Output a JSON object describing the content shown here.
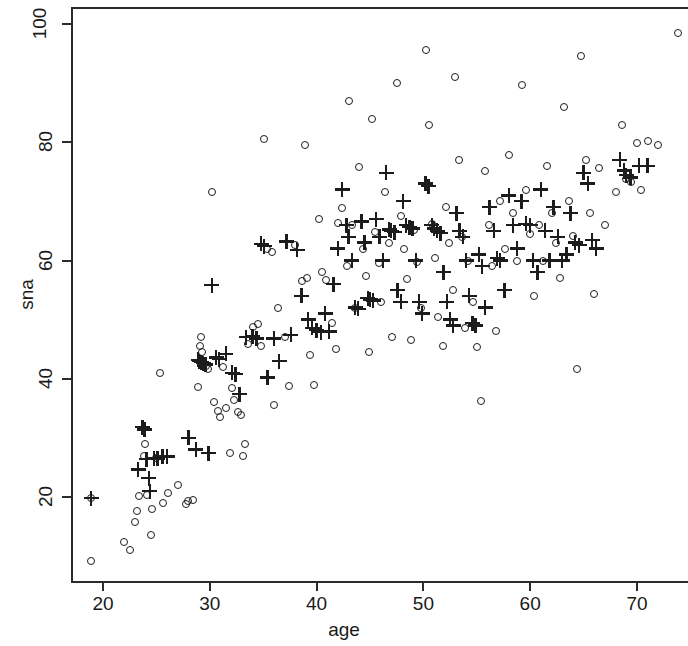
{
  "chart_data": {
    "type": "scatter",
    "title": "",
    "xlabel": "age",
    "ylabel": "sna",
    "xlim": [
      17.2,
      74.8
    ],
    "ylim": [
      7.3,
      104.0
    ],
    "xticks": [
      20,
      30,
      40,
      50,
      60,
      70
    ],
    "yticks": [
      20,
      40,
      60,
      80,
      100
    ],
    "grid": false,
    "legend": null,
    "frame": "box-open-right",
    "series": [
      {
        "name": "circle",
        "marker": "open-circle",
        "color": "#1c1c1c",
        "points": [
          [
            18.9,
            9.2
          ],
          [
            18.9,
            19.8
          ],
          [
            22.0,
            12.4
          ],
          [
            22.5,
            11.0
          ],
          [
            23.0,
            15.8
          ],
          [
            23.2,
            17.6
          ],
          [
            23.4,
            20.1
          ],
          [
            23.8,
            27.0
          ],
          [
            23.9,
            28.9
          ],
          [
            24.1,
            20.4
          ],
          [
            24.5,
            13.6
          ],
          [
            24.6,
            18.0
          ],
          [
            25.0,
            26.6
          ],
          [
            25.3,
            41.0
          ],
          [
            25.6,
            19.0
          ],
          [
            26.1,
            20.6
          ],
          [
            27.0,
            22.0
          ],
          [
            27.8,
            18.8
          ],
          [
            28.0,
            19.3
          ],
          [
            28.4,
            19.5
          ],
          [
            28.9,
            38.6
          ],
          [
            29.1,
            45.5
          ],
          [
            29.2,
            47.0
          ],
          [
            29.3,
            44.5
          ],
          [
            29.4,
            43.0
          ],
          [
            29.6,
            42.2
          ],
          [
            29.8,
            41.6
          ],
          [
            30.2,
            71.6
          ],
          [
            30.4,
            36.0
          ],
          [
            30.8,
            34.5
          ],
          [
            31.0,
            33.6
          ],
          [
            31.2,
            42.0
          ],
          [
            31.5,
            35.0
          ],
          [
            31.9,
            27.4
          ],
          [
            32.1,
            38.5
          ],
          [
            32.3,
            36.4
          ],
          [
            32.6,
            34.3
          ],
          [
            32.9,
            33.8
          ],
          [
            33.1,
            26.9
          ],
          [
            33.3,
            29.0
          ],
          [
            33.6,
            45.8
          ],
          [
            34.0,
            48.8
          ],
          [
            34.5,
            49.2
          ],
          [
            34.8,
            45.6
          ],
          [
            35.1,
            80.6
          ],
          [
            35.4,
            62.0
          ],
          [
            35.8,
            61.4
          ],
          [
            36.0,
            35.5
          ],
          [
            36.4,
            52.0
          ],
          [
            37.0,
            47.0
          ],
          [
            37.4,
            38.8
          ],
          [
            38.0,
            62.6
          ],
          [
            38.6,
            56.5
          ],
          [
            38.9,
            79.6
          ],
          [
            39.1,
            57.0
          ],
          [
            39.4,
            44.0
          ],
          [
            39.8,
            39.0
          ],
          [
            40.2,
            67.0
          ],
          [
            40.5,
            58.0
          ],
          [
            40.9,
            56.7
          ],
          [
            41.4,
            49.5
          ],
          [
            41.8,
            45.0
          ],
          [
            42.0,
            66.4
          ],
          [
            42.4,
            68.8
          ],
          [
            42.8,
            59.0
          ],
          [
            43.0,
            87.0
          ],
          [
            43.3,
            66.0
          ],
          [
            43.6,
            52.0
          ],
          [
            44.0,
            75.8
          ],
          [
            44.3,
            62.0
          ],
          [
            44.6,
            57.4
          ],
          [
            44.9,
            44.6
          ],
          [
            45.2,
            84.0
          ],
          [
            45.5,
            64.8
          ],
          [
            45.8,
            59.6
          ],
          [
            46.0,
            53.0
          ],
          [
            46.4,
            71.6
          ],
          [
            46.8,
            63.0
          ],
          [
            47.1,
            47.0
          ],
          [
            47.5,
            90.0
          ],
          [
            47.9,
            67.6
          ],
          [
            48.2,
            62.0
          ],
          [
            48.5,
            56.8
          ],
          [
            48.8,
            46.5
          ],
          [
            49.1,
            65.2
          ],
          [
            49.4,
            59.8
          ],
          [
            49.8,
            52.0
          ],
          [
            50.2,
            95.6
          ],
          [
            50.5,
            83.0
          ],
          [
            50.8,
            66.2
          ],
          [
            51.1,
            60.4
          ],
          [
            51.4,
            50.5
          ],
          [
            51.8,
            45.5
          ],
          [
            52.1,
            69.0
          ],
          [
            52.4,
            63.0
          ],
          [
            52.8,
            55.0
          ],
          [
            53.0,
            91.0
          ],
          [
            53.3,
            77.0
          ],
          [
            53.6,
            64.0
          ],
          [
            53.9,
            48.6
          ],
          [
            54.2,
            60.0
          ],
          [
            54.6,
            53.0
          ],
          [
            55.0,
            45.4
          ],
          [
            55.4,
            36.2
          ],
          [
            55.8,
            75.2
          ],
          [
            56.1,
            66.0
          ],
          [
            56.4,
            59.0
          ],
          [
            56.8,
            48.0
          ],
          [
            57.2,
            70.0
          ],
          [
            57.6,
            62.0
          ],
          [
            58.0,
            77.8
          ],
          [
            58.4,
            68.0
          ],
          [
            58.8,
            60.0
          ],
          [
            59.2,
            89.6
          ],
          [
            59.6,
            72.0
          ],
          [
            60.0,
            64.5
          ],
          [
            60.4,
            54.0
          ],
          [
            60.8,
            66.0
          ],
          [
            61.2,
            60.0
          ],
          [
            61.6,
            76.0
          ],
          [
            62.0,
            68.0
          ],
          [
            62.4,
            63.0
          ],
          [
            62.8,
            57.0
          ],
          [
            63.2,
            86.0
          ],
          [
            63.6,
            70.0
          ],
          [
            64.0,
            64.2
          ],
          [
            64.4,
            41.6
          ],
          [
            64.8,
            94.6
          ],
          [
            65.2,
            77.0
          ],
          [
            65.6,
            68.0
          ],
          [
            66.0,
            54.4
          ],
          [
            66.4,
            75.6
          ],
          [
            67.0,
            66.0
          ],
          [
            68.0,
            71.6
          ],
          [
            68.6,
            83.0
          ],
          [
            69.0,
            73.8
          ],
          [
            69.4,
            73.2
          ],
          [
            70.0,
            79.8
          ],
          [
            70.4,
            72.0
          ],
          [
            71.0,
            80.2
          ],
          [
            72.0,
            79.6
          ],
          [
            73.8,
            98.4
          ]
        ]
      },
      {
        "name": "plus",
        "marker": "plus",
        "color": "#1c1c1c",
        "points": [
          [
            18.9,
            19.8
          ],
          [
            23.3,
            24.6
          ],
          [
            23.7,
            31.8
          ],
          [
            23.9,
            31.4
          ],
          [
            24.1,
            26.4
          ],
          [
            24.3,
            23.2
          ],
          [
            24.4,
            21.0
          ],
          [
            24.8,
            26.5
          ],
          [
            25.1,
            26.5
          ],
          [
            25.6,
            26.8
          ],
          [
            26.0,
            26.8
          ],
          [
            28.0,
            30.0
          ],
          [
            28.7,
            28.0
          ],
          [
            28.9,
            43.2
          ],
          [
            29.0,
            43.0
          ],
          [
            29.2,
            42.8
          ],
          [
            29.4,
            42.6
          ],
          [
            29.6,
            42.4
          ],
          [
            29.9,
            27.4
          ],
          [
            30.2,
            55.8
          ],
          [
            30.6,
            43.6
          ],
          [
            30.9,
            43.3
          ],
          [
            31.5,
            44.2
          ],
          [
            32.1,
            41.0
          ],
          [
            32.4,
            40.8
          ],
          [
            32.8,
            37.4
          ],
          [
            33.4,
            47.0
          ],
          [
            34.0,
            47.2
          ],
          [
            34.4,
            46.8
          ],
          [
            34.8,
            62.8
          ],
          [
            35.1,
            62.4
          ],
          [
            35.4,
            40.2
          ],
          [
            36.0,
            46.8
          ],
          [
            36.5,
            43.0
          ],
          [
            37.2,
            63.2
          ],
          [
            37.6,
            47.4
          ],
          [
            38.2,
            61.8
          ],
          [
            38.6,
            54.0
          ],
          [
            39.2,
            50.0
          ],
          [
            39.6,
            48.6
          ],
          [
            40.0,
            48.2
          ],
          [
            40.4,
            47.9
          ],
          [
            40.8,
            51.0
          ],
          [
            41.2,
            48.0
          ],
          [
            41.6,
            56.0
          ],
          [
            42.0,
            62.0
          ],
          [
            42.4,
            72.0
          ],
          [
            42.8,
            66.0
          ],
          [
            43.0,
            64.0
          ],
          [
            43.3,
            60.0
          ],
          [
            43.6,
            52.0
          ],
          [
            43.9,
            51.8
          ],
          [
            44.2,
            66.6
          ],
          [
            44.5,
            63.0
          ],
          [
            44.8,
            53.6
          ],
          [
            45.0,
            53.4
          ],
          [
            45.3,
            53.2
          ],
          [
            45.6,
            67.0
          ],
          [
            45.9,
            64.0
          ],
          [
            46.2,
            60.0
          ],
          [
            46.5,
            74.8
          ],
          [
            46.8,
            65.2
          ],
          [
            47.0,
            65.0
          ],
          [
            47.3,
            64.8
          ],
          [
            47.6,
            55.0
          ],
          [
            47.9,
            53.0
          ],
          [
            48.1,
            70.0
          ],
          [
            48.4,
            66.0
          ],
          [
            48.7,
            65.6
          ],
          [
            49.0,
            65.4
          ],
          [
            49.3,
            60.0
          ],
          [
            49.6,
            53.0
          ],
          [
            49.9,
            51.0
          ],
          [
            50.2,
            73.0
          ],
          [
            50.5,
            72.6
          ],
          [
            50.8,
            66.0
          ],
          [
            51.0,
            65.4
          ],
          [
            51.3,
            65.0
          ],
          [
            51.6,
            64.6
          ],
          [
            51.9,
            58.0
          ],
          [
            52.2,
            53.0
          ],
          [
            52.5,
            50.0
          ],
          [
            52.8,
            49.0
          ],
          [
            53.1,
            68.0
          ],
          [
            53.4,
            65.0
          ],
          [
            53.7,
            64.0
          ],
          [
            54.0,
            60.0
          ],
          [
            54.3,
            54.0
          ],
          [
            54.6,
            49.4
          ],
          [
            54.9,
            49.0
          ],
          [
            55.2,
            61.0
          ],
          [
            55.5,
            59.0
          ],
          [
            55.8,
            52.0
          ],
          [
            56.2,
            69.0
          ],
          [
            56.6,
            65.0
          ],
          [
            56.9,
            60.4
          ],
          [
            57.2,
            60.0
          ],
          [
            57.6,
            55.0
          ],
          [
            58.0,
            71.0
          ],
          [
            58.4,
            66.0
          ],
          [
            58.8,
            62.0
          ],
          [
            59.2,
            70.0
          ],
          [
            59.6,
            66.2
          ],
          [
            60.0,
            66.0
          ],
          [
            60.3,
            60.0
          ],
          [
            60.7,
            58.0
          ],
          [
            61.0,
            72.0
          ],
          [
            61.4,
            65.0
          ],
          [
            61.8,
            60.0
          ],
          [
            62.2,
            69.0
          ],
          [
            62.6,
            64.0
          ],
          [
            63.0,
            60.0
          ],
          [
            63.4,
            61.0
          ],
          [
            63.8,
            68.0
          ],
          [
            64.2,
            63.0
          ],
          [
            64.6,
            62.6
          ],
          [
            65.0,
            74.8
          ],
          [
            65.4,
            73.0
          ],
          [
            65.8,
            63.4
          ],
          [
            66.2,
            62.0
          ],
          [
            68.4,
            77.0
          ],
          [
            68.8,
            75.2
          ],
          [
            69.0,
            74.4
          ],
          [
            69.4,
            74.0
          ],
          [
            70.2,
            76.0
          ],
          [
            71.0,
            76.0
          ]
        ]
      }
    ]
  },
  "axes": {
    "xlabel": "age",
    "ylabel": "sna",
    "xticks": [
      "20",
      "30",
      "40",
      "50",
      "60",
      "70"
    ],
    "yticks": [
      "20",
      "40",
      "60",
      "80",
      "100"
    ]
  }
}
